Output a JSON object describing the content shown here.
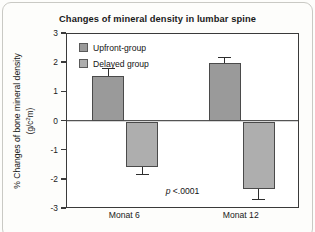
{
  "chart_data": {
    "type": "bar",
    "title": "Changes of mineral density in lumbar spine",
    "xlabel": "",
    "ylabel": "% Changes of bone mineral density",
    "ylabel_unit": "(g/c2m)",
    "categories": [
      "Monat 6",
      "Monat 12"
    ],
    "ylim": [
      -3,
      3
    ],
    "yticks": [
      "3",
      "2",
      "1",
      "0",
      "-1",
      "-2",
      "-3"
    ],
    "ytick_values": [
      3,
      2,
      1,
      0,
      -1,
      -2,
      -3
    ],
    "grid": false,
    "legend_position": "top-left inside plot",
    "series": [
      {
        "name": "Upfront-group",
        "color": "#9a9a9a",
        "values": [
          1.57,
          2.0
        ],
        "errors": [
          0.25,
          0.2
        ]
      },
      {
        "name": "Delayed group",
        "color": "#aeaeae",
        "values": [
          -1.57,
          -2.3
        ],
        "errors": [
          0.25,
          0.38
        ]
      }
    ],
    "annotations": [
      {
        "text": "p <.0001",
        "italic_prefix": "p",
        "rest": " <.0001"
      }
    ]
  },
  "legend": {
    "items": [
      {
        "label": "Upfront-group"
      },
      {
        "label": "Delayed group"
      }
    ]
  },
  "axis": {
    "y_title_main": "% Changes of bone mineral density",
    "y_title_unit_pre": "(g/c",
    "y_title_unit_sup": "2",
    "y_title_unit_post": "m)"
  },
  "annotation": {
    "p_char": "p",
    "p_rest": " <.0001"
  }
}
